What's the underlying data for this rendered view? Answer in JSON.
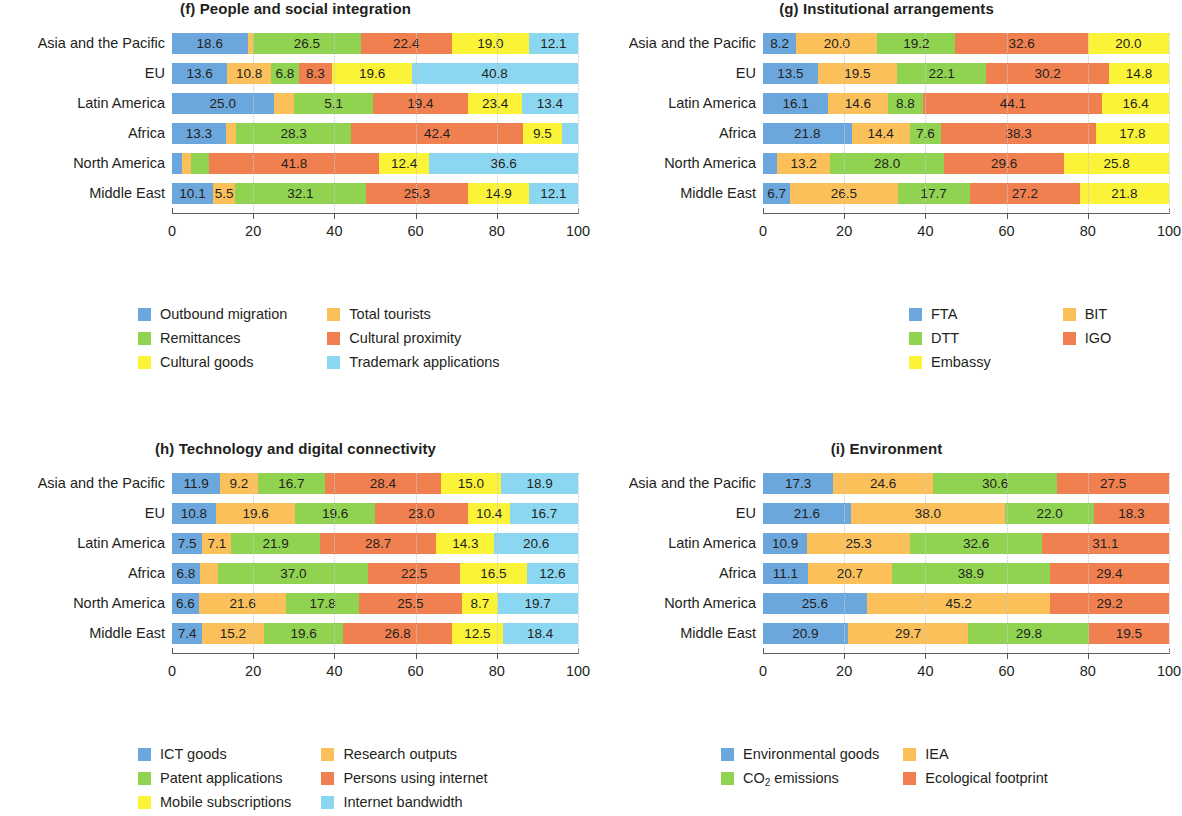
{
  "figure": {
    "regions": [
      "Asia and the Pacific",
      "EU",
      "Latin America",
      "Africa",
      "North America",
      "Middle East"
    ],
    "axis_ticks": [
      "0",
      "20",
      "40",
      "60",
      "80",
      "100"
    ],
    "palette": {
      "blue": "#6BA7DD",
      "orange": "#FBC05A",
      "green": "#8FD350",
      "red_orange": "#F0804F",
      "yellow": "#FAF338",
      "light_blue": "#8BD7F2"
    }
  },
  "chart_data": [
    {
      "id": "f",
      "type": "bar",
      "title": "(f) People and social integration",
      "subplot_label": "(f)",
      "orientation": "horizontal",
      "stacked": true,
      "normalized_percent": true,
      "xlabel": "",
      "ylabel": "",
      "xlim": [
        0,
        100
      ],
      "grid": true,
      "legend_position": "below",
      "categories": [
        "Asia and the Pacific",
        "EU",
        "Latin America",
        "Africa",
        "North America",
        "Middle East"
      ],
      "xticks": [
        "0",
        "20",
        "40",
        "60",
        "80",
        "100"
      ],
      "series": [
        {
          "name": "Outbound migration",
          "color": "#6BA7DD",
          "values": [
            18.6,
            13.6,
            25.0,
            13.3,
            2.5,
            10.1
          ]
        },
        {
          "name": "Total tourists",
          "color": "#FBC05A",
          "values": [
            1.4,
            10.8,
            5.1,
            2.5,
            2.3,
            5.5
          ]
        },
        {
          "name": "Remittances",
          "color": "#8FD350",
          "values": [
            26.5,
            6.8,
            19.4,
            28.3,
            4.4,
            32.1
          ]
        },
        {
          "name": "Cultural proximity",
          "color": "#F0804F",
          "values": [
            22.4,
            8.3,
            23.4,
            42.4,
            41.8,
            25.3
          ]
        },
        {
          "name": "Cultural goods",
          "color": "#FAF338",
          "values": [
            19.0,
            19.6,
            13.4,
            9.5,
            12.4,
            14.9
          ]
        },
        {
          "name": "Trademark applications",
          "color": "#8BD7F2",
          "values": [
            12.1,
            40.8,
            13.6,
            4.0,
            36.6,
            12.1
          ]
        }
      ],
      "bar_labels": [
        [
          "18.6",
          "",
          "26.5",
          "22.4",
          "19.0",
          "12.1"
        ],
        [
          "13.6",
          "10.8",
          "6.8",
          "8.3",
          "19.6",
          "40.8"
        ],
        [
          "25.0",
          "",
          "5.1",
          "19.4",
          "23.4",
          "13.4",
          "13.6"
        ],
        [
          "13.3",
          "",
          "28.3",
          "42.4",
          "9.5",
          ""
        ],
        [
          "",
          "",
          "",
          "41.8",
          "12.4",
          "36.6"
        ],
        [
          "10.1",
          "5.5",
          "32.1",
          "25.3",
          "14.9",
          "12.1"
        ]
      ],
      "legend": [
        {
          "label": "Outbound migration",
          "color": "#6BA7DD"
        },
        {
          "label": "Remittances",
          "color": "#8FD350"
        },
        {
          "label": "Cultural goods",
          "color": "#FAF338"
        },
        {
          "label": "Total tourists",
          "color": "#FBC05A"
        },
        {
          "label": "Cultural proximity",
          "color": "#F0804F"
        },
        {
          "label": "Trademark applications",
          "color": "#8BD7F2"
        }
      ]
    },
    {
      "id": "g",
      "type": "bar",
      "title": "(g) Institutional arrangements",
      "subplot_label": "(g)",
      "orientation": "horizontal",
      "stacked": true,
      "normalized_percent": true,
      "xlabel": "",
      "ylabel": "",
      "xlim": [
        0,
        100
      ],
      "grid": true,
      "legend_position": "below",
      "categories": [
        "Asia and the Pacific",
        "EU",
        "Latin America",
        "Africa",
        "North America",
        "Middle East"
      ],
      "xticks": [
        "0",
        "20",
        "40",
        "60",
        "80",
        "100"
      ],
      "series": [
        {
          "name": "FTA",
          "color": "#6BA7DD",
          "values": [
            8.2,
            13.5,
            16.1,
            21.8,
            3.4,
            6.7
          ]
        },
        {
          "name": "BIT",
          "color": "#FBC05A",
          "values": [
            20.0,
            19.5,
            14.6,
            14.4,
            13.2,
            26.5
          ]
        },
        {
          "name": "DTT",
          "color": "#8FD350",
          "values": [
            19.2,
            22.1,
            8.8,
            7.6,
            28.0,
            17.7
          ]
        },
        {
          "name": "IGO",
          "color": "#F0804F",
          "values": [
            32.6,
            30.2,
            44.1,
            38.3,
            29.6,
            27.2
          ]
        },
        {
          "name": "Embassy",
          "color": "#FAF338",
          "values": [
            20.0,
            14.8,
            16.4,
            17.8,
            25.8,
            21.8
          ]
        }
      ],
      "bar_labels": [
        [
          "8.2",
          "20.0",
          "19.2",
          "32.6",
          "20.0"
        ],
        [
          "13.5",
          "19.5",
          "22.1",
          "30.2",
          "14.8"
        ],
        [
          "16.1",
          "14.6",
          "8.8",
          "44.1",
          "16.4"
        ],
        [
          "21.8",
          "14.4",
          "7.6",
          "38.3",
          "17.8"
        ],
        [
          "",
          "13.2",
          "28.0",
          "29.6",
          "25.8"
        ],
        [
          "6.7",
          "26.5",
          "17.7",
          "27.2",
          "21.8"
        ]
      ],
      "legend": [
        {
          "label": "FTA",
          "color": "#6BA7DD"
        },
        {
          "label": "DTT",
          "color": "#8FD350"
        },
        {
          "label": "Embassy",
          "color": "#FAF338"
        },
        {
          "label": "BIT",
          "color": "#FBC05A"
        },
        {
          "label": "IGO",
          "color": "#F0804F"
        }
      ]
    },
    {
      "id": "h",
      "type": "bar",
      "title": "(h) Technology and digital connectivity",
      "subplot_label": "(h)",
      "orientation": "horizontal",
      "stacked": true,
      "normalized_percent": true,
      "xlabel": "",
      "ylabel": "",
      "xlim": [
        0,
        100
      ],
      "grid": true,
      "legend_position": "below",
      "categories": [
        "Asia and the Pacific",
        "EU",
        "Latin America",
        "Africa",
        "North America",
        "Middle East"
      ],
      "xticks": [
        "0",
        "20",
        "40",
        "60",
        "80",
        "100"
      ],
      "series": [
        {
          "name": "ICT goods",
          "color": "#6BA7DD",
          "values": [
            11.9,
            10.8,
            7.5,
            6.8,
            6.6,
            7.4
          ]
        },
        {
          "name": "Research outputs",
          "color": "#FBC05A",
          "values": [
            9.2,
            19.6,
            7.1,
            4.6,
            21.6,
            15.2
          ]
        },
        {
          "name": "Patent applications",
          "color": "#8FD350",
          "values": [
            16.7,
            19.6,
            21.9,
            37.0,
            17.8,
            19.6
          ]
        },
        {
          "name": "Persons using internet",
          "color": "#F0804F",
          "values": [
            28.4,
            23.0,
            28.7,
            22.5,
            25.5,
            26.8
          ]
        },
        {
          "name": "Mobile subscriptions",
          "color": "#FAF338",
          "values": [
            15.0,
            10.4,
            14.3,
            16.5,
            8.7,
            12.5
          ]
        },
        {
          "name": "Internet bandwidth",
          "color": "#8BD7F2",
          "values": [
            18.9,
            16.7,
            20.6,
            12.6,
            19.7,
            18.4
          ]
        }
      ],
      "bar_labels": [
        [
          "11.9",
          "9.2",
          "16.7",
          "28.4",
          "15.0",
          "18.9"
        ],
        [
          "10.8",
          "19.6",
          "19.6",
          "23.0",
          "10.4",
          "16.7"
        ],
        [
          "7.5",
          "7.1",
          "21.9",
          "28.7",
          "14.3",
          "20.6"
        ],
        [
          "6.8",
          "",
          "37.0",
          "22.5",
          "16.5",
          "12.6"
        ],
        [
          "6.6",
          "21.6",
          "17.8",
          "25.5",
          "8.7",
          "19.7"
        ],
        [
          "7.4",
          "15.2",
          "19.6",
          "26.8",
          "12.5",
          "18.4"
        ]
      ],
      "legend": [
        {
          "label": "ICT goods",
          "color": "#6BA7DD"
        },
        {
          "label": "Patent applications",
          "color": "#8FD350"
        },
        {
          "label": "Mobile subscriptions",
          "color": "#FAF338"
        },
        {
          "label": "Research outputs",
          "color": "#FBC05A"
        },
        {
          "label": "Persons using internet",
          "color": "#F0804F"
        },
        {
          "label": "Internet bandwidth",
          "color": "#8BD7F2"
        }
      ]
    },
    {
      "id": "i",
      "type": "bar",
      "title": "(i) Environment",
      "subplot_label": "(i)",
      "orientation": "horizontal",
      "stacked": true,
      "normalized_percent": true,
      "xlabel": "",
      "ylabel": "",
      "xlim": [
        0,
        100
      ],
      "grid": true,
      "legend_position": "below",
      "categories": [
        "Asia and the Pacific",
        "EU",
        "Latin America",
        "Africa",
        "North America",
        "Middle East"
      ],
      "xticks": [
        "0",
        "20",
        "40",
        "60",
        "80",
        "100"
      ],
      "series": [
        {
          "name": "Environmental goods",
          "color": "#6BA7DD",
          "values": [
            17.3,
            21.6,
            10.9,
            11.1,
            25.6,
            20.9
          ]
        },
        {
          "name": "IEA",
          "color": "#FBC05A",
          "values": [
            24.6,
            38.0,
            25.3,
            20.7,
            45.2,
            29.7
          ]
        },
        {
          "name": "CO2 emissions",
          "color": "#8FD350",
          "values": [
            30.6,
            22.0,
            32.6,
            38.9,
            0.0,
            29.8
          ]
        },
        {
          "name": "Ecological footprint",
          "color": "#F0804F",
          "values": [
            27.5,
            18.3,
            31.1,
            29.4,
            29.2,
            19.5
          ]
        }
      ],
      "bar_labels": [
        [
          "17.3",
          "24.6",
          "30.6",
          "27.5"
        ],
        [
          "21.6",
          "38.0",
          "22.0",
          "18.3"
        ],
        [
          "10.9",
          "25.3",
          "32.6",
          "31.1"
        ],
        [
          "11.1",
          "20.7",
          "38.9",
          "29.4"
        ],
        [
          "25.6",
          "45.2",
          "",
          "29.2"
        ],
        [
          "20.9",
          "29.7",
          "29.8",
          "19.5"
        ]
      ],
      "legend": [
        {
          "label": "Environmental goods",
          "color": "#6BA7DD",
          "sub": null
        },
        {
          "label": "CO",
          "color": "#8FD350",
          "sub": "2",
          "after": " emissions"
        },
        {
          "label": "IEA",
          "color": "#FBC05A",
          "sub": null
        },
        {
          "label": "Ecological footprint",
          "color": "#F0804F",
          "sub": null
        }
      ]
    }
  ]
}
